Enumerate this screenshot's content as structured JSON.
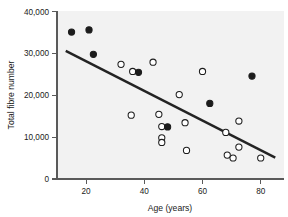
{
  "chart_data": {
    "type": "scatter",
    "title": "",
    "xlabel": "Age (years)",
    "ylabel": "Total fibre number",
    "xlim": [
      10,
      88
    ],
    "ylim": [
      0,
      40000
    ],
    "xticks": [
      20,
      40,
      60,
      80
    ],
    "xtick_labels": [
      "20",
      "40",
      "60",
      "80"
    ],
    "yticks": [
      0,
      10000,
      20000,
      30000,
      40000
    ],
    "ytick_labels": [
      "0",
      "10,000",
      "20,000",
      "30,000",
      "40,000"
    ],
    "grid": false,
    "legend": "none",
    "series": [
      {
        "name": "filled-markers",
        "marker": "filled-circle",
        "color": "#1c1c1c",
        "points": [
          {
            "x": 15,
            "y": 35000
          },
          {
            "x": 21,
            "y": 35500
          },
          {
            "x": 22.5,
            "y": 29700
          },
          {
            "x": 38,
            "y": 25400
          },
          {
            "x": 48,
            "y": 12400
          },
          {
            "x": 62.5,
            "y": 18000
          },
          {
            "x": 77,
            "y": 24500
          }
        ]
      },
      {
        "name": "open-markers",
        "marker": "open-circle",
        "color": "#ffffff",
        "points": [
          {
            "x": 32,
            "y": 27300
          },
          {
            "x": 36,
            "y": 25600
          },
          {
            "x": 43,
            "y": 27800
          },
          {
            "x": 35.5,
            "y": 15200
          },
          {
            "x": 45,
            "y": 15400
          },
          {
            "x": 46,
            "y": 12500
          },
          {
            "x": 46,
            "y": 9800
          },
          {
            "x": 46,
            "y": 8700
          },
          {
            "x": 52,
            "y": 20100
          },
          {
            "x": 54,
            "y": 13400
          },
          {
            "x": 54.5,
            "y": 6800
          },
          {
            "x": 60,
            "y": 25600
          },
          {
            "x": 68,
            "y": 11100
          },
          {
            "x": 68.5,
            "y": 5700
          },
          {
            "x": 70.5,
            "y": 5000
          },
          {
            "x": 72.5,
            "y": 13800
          },
          {
            "x": 72.5,
            "y": 7600
          },
          {
            "x": 80,
            "y": 5000
          }
        ]
      }
    ],
    "fit_line": {
      "name": "regression-line",
      "color": "#232323",
      "x_start": 13,
      "y_start": 30500,
      "x_end": 85,
      "y_end": 5100
    }
  }
}
